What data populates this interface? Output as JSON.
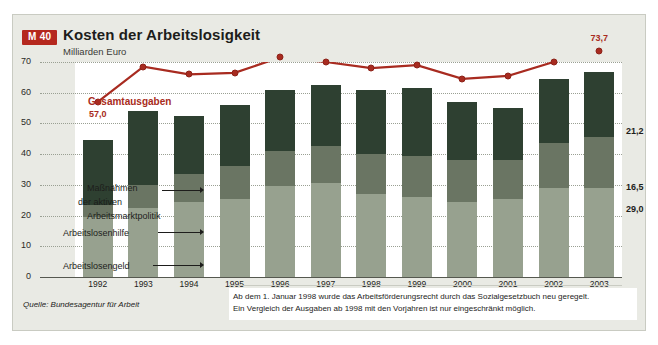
{
  "header": {
    "badge": "M 40",
    "title": "Kosten der Arbeitslosigkeit",
    "subtitle": "Milliarden Euro"
  },
  "annotations": {
    "series_label": "Gesamtausgaben",
    "first_value_label": "57,0",
    "last_value_label": "73,7",
    "massnahmen_line1": "Maßnahmen",
    "massnahmen_line2": "der aktiven",
    "massnahmen_line3": "Arbeitsmarktpolitik",
    "arbeitslosenhilfe": "Arbeitslosenhilfe",
    "arbeitslosengeld": "Arbeitslosengeld",
    "right_massnahmen": "21,2",
    "right_arbeitslosenhilfe": "16,5",
    "right_arbeitslosengeld": "29,0"
  },
  "footer": {
    "source": "Quelle: Bundesagentur für Arbeit",
    "note_line1": "Ab dem 1. Januar 1998 wurde das Arbeitsförderungsrecht durch das Sozialgesetzbuch neu geregelt.",
    "note_line2": "Ein Vergleich der Ausgaben ab 1998 mit den Vorjahren ist nur eingeschränkt möglich."
  },
  "colors": {
    "badge_red": "#b5281e",
    "line_red": "#a82b20",
    "massnahmen": "#2e4031",
    "arbeitslosenhilfe": "#6a7563",
    "arbeitslosengeld": "#97a18f",
    "card_background": "#e9eae4",
    "panel_background": "#ffffff"
  },
  "chart_data": {
    "type": "bar",
    "title": "Kosten der Arbeitslosigkeit",
    "subtitle": "Milliarden Euro",
    "xlabel": "",
    "ylabel": "Milliarden Euro",
    "ylim": [
      0,
      70
    ],
    "yticks": [
      0,
      10,
      20,
      30,
      40,
      50,
      60,
      70
    ],
    "ytick_labels": [
      "0",
      "10",
      "20",
      "30",
      "40",
      "50",
      "60",
      "70"
    ],
    "grid": true,
    "legend_position": "inline-annotations",
    "categories": [
      "1992",
      "1993",
      "1994",
      "1995",
      "1996",
      "1997",
      "1998",
      "1999",
      "2000",
      "2001",
      "2002",
      "2003"
    ],
    "stacked": true,
    "series": [
      {
        "name": "Arbeitslosengeld",
        "color": "#97a18f",
        "values": [
          19.5,
          22.5,
          24.5,
          25.5,
          29.5,
          30.5,
          27.0,
          26.0,
          24.5,
          25.5,
          29.0,
          29.0
        ]
      },
      {
        "name": "Arbeitslosenhilfe",
        "color": "#6a7563",
        "values": [
          4.0,
          7.5,
          9.0,
          10.5,
          11.5,
          12.0,
          13.0,
          13.5,
          13.5,
          12.5,
          14.5,
          16.5
        ]
      },
      {
        "name": "Maßnahmen der aktiven Arbeitsmarktpolitik",
        "color": "#2e4031",
        "values": [
          21.0,
          24.0,
          19.0,
          20.0,
          20.0,
          20.0,
          21.0,
          22.0,
          19.0,
          17.0,
          21.0,
          21.2
        ]
      }
    ],
    "line_series": {
      "name": "Gesamtausgaben",
      "color": "#a82b20",
      "values": [
        57.0,
        68.5,
        66.0,
        66.5,
        71.5,
        70.0,
        68.0,
        69.0,
        64.5,
        65.5,
        70.0,
        73.7
      ],
      "labeled_points": [
        {
          "category": "1992",
          "label": "57,0"
        },
        {
          "category": "2003",
          "label": "73,7"
        }
      ]
    },
    "right_labels": [
      {
        "series": "Maßnahmen der aktiven Arbeitsmarktpolitik",
        "value": 21.2,
        "label": "21,2"
      },
      {
        "series": "Arbeitslosenhilfe",
        "value": 16.5,
        "label": "16,5"
      },
      {
        "series": "Arbeitslosengeld",
        "value": 29.0,
        "label": "29,0"
      }
    ],
    "source": "Quelle: Bundesagentur für Arbeit"
  }
}
